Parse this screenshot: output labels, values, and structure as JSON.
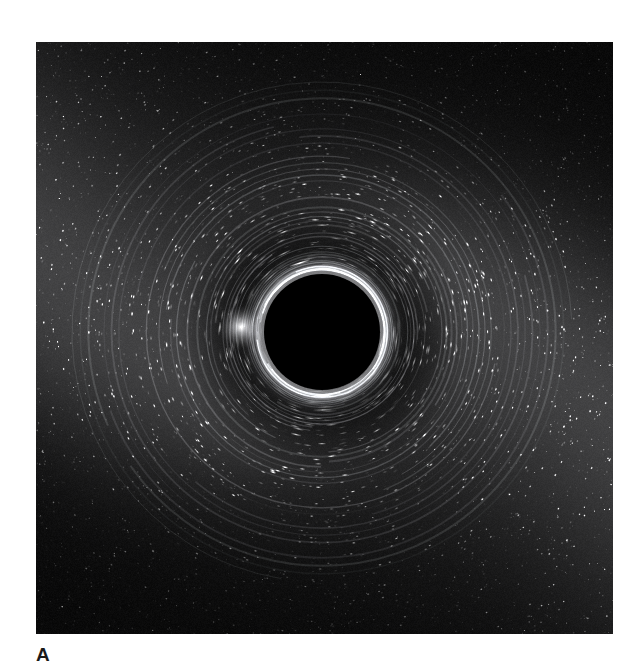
{
  "figure": {
    "panel_label": "A",
    "caption_text": "",
    "background_color": "#ffffff"
  },
  "image_panel": {
    "name": "black-hole-gravitational-lensing-simulation",
    "alt_description": "Simulated image of a black hole gravitationally lensing a dense background starfield and the Milky Way band",
    "frame": {
      "x": 36,
      "y": 42,
      "width": 577,
      "height": 592
    },
    "border_color": "#000000",
    "background_color": "#050505"
  },
  "chart_data": {
    "type": "heatmap",
    "title": "",
    "subtitle": "",
    "xlabel": "",
    "ylabel": "",
    "legend": [],
    "grid": false,
    "colormap": "grayscale",
    "value_range": [
      0,
      255
    ],
    "scene": {
      "subject": "black hole shadow with gravitationally lensed starfield",
      "shadow": {
        "label": "black hole shadow",
        "center_x": 286,
        "center_y": 290,
        "radius": 58,
        "fill_color": "#000000"
      },
      "photon_ring": {
        "label": "photon ring / Einstein ring",
        "center_x": 286,
        "center_y": 290,
        "radius": 66,
        "color": "#9a9a9a",
        "intensity": 0.55
      },
      "lensing_arcs": {
        "label": "concentric lensed arcs",
        "center_x": 286,
        "center_y": 290,
        "inner_radius": 62,
        "outer_radius": 250,
        "count": 46,
        "color": "#b4b4b4"
      },
      "milky_way_band": {
        "label": "lensed Milky Way band",
        "orientation_degrees": 38,
        "peak_brightness": 0.72,
        "regions": [
          "lower-left",
          "upper-right",
          "right-edge"
        ]
      },
      "bright_lensed_feature": {
        "label": "bright lensed star image",
        "x": 205,
        "y": 285,
        "radius": 9,
        "brightness": 1.0
      },
      "starfield": {
        "label": "background starfield",
        "star_count": 9000,
        "min_size": 0.4,
        "max_size": 2.2,
        "color": "#ffffff"
      }
    },
    "axis_ranges": {
      "x": [
        0,
        577
      ],
      "y": [
        0,
        592
      ]
    }
  }
}
